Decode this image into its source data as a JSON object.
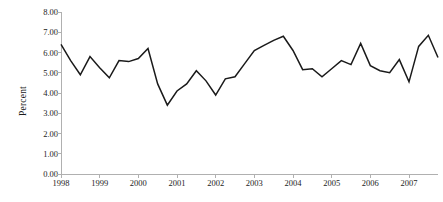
{
  "chart_data": {
    "type": "line",
    "title": "",
    "subtitle": "",
    "xlabel": "",
    "ylabel": "Percent",
    "ylim": [
      0,
      8
    ],
    "ytick_step": 1,
    "ytick_labels": [
      "8.00",
      "7.00",
      "6.00",
      "5.00",
      "4.00",
      "3.00",
      "2.00",
      "1.00",
      "0.00"
    ],
    "ytick_values": [
      8,
      7,
      6,
      5,
      4,
      3,
      2,
      1,
      0
    ],
    "xtick_labels": [
      "1998",
      "1999",
      "2000",
      "2001",
      "2002",
      "2003",
      "2004",
      "2005",
      "2006",
      "2007"
    ],
    "xtick_values": [
      1998,
      1999,
      2000,
      2001,
      2002,
      2003,
      2004,
      2005,
      2006,
      2007
    ],
    "xlim": [
      1998,
      2007.75
    ],
    "grid": false,
    "legend": false,
    "legend_position": "none",
    "series_color": "#1a1a1a",
    "axis_color": "#b0b0b0",
    "frequency": "quarterly",
    "series": [
      {
        "name": "Percent",
        "x": [
          1998.0,
          1998.25,
          1998.5,
          1998.75,
          1999.0,
          1999.25,
          1999.5,
          1999.75,
          2000.0,
          2000.25,
          2000.5,
          2000.75,
          2001.0,
          2001.25,
          2001.5,
          2001.75,
          2002.0,
          2002.25,
          2002.5,
          2002.75,
          2003.0,
          2003.25,
          2003.5,
          2003.75,
          2004.0,
          2004.25,
          2004.5,
          2004.75,
          2005.0,
          2005.25,
          2005.5,
          2005.75,
          2006.0,
          2006.25,
          2006.5,
          2006.75,
          2007.0,
          2007.25,
          2007.5,
          2007.75
        ],
        "values": [
          6.4,
          5.6,
          4.9,
          5.8,
          5.25,
          4.75,
          5.6,
          5.55,
          5.7,
          6.2,
          4.45,
          3.4,
          4.1,
          4.45,
          5.1,
          4.6,
          3.9,
          4.7,
          4.8,
          5.45,
          6.1,
          6.35,
          6.6,
          6.8,
          6.1,
          5.15,
          5.2,
          4.8,
          5.2,
          5.6,
          5.4,
          6.45,
          5.35,
          5.1,
          5.0,
          5.65,
          4.55,
          6.3,
          6.85,
          5.75
        ]
      }
    ],
    "min_value": 3.4,
    "max_value": 6.85
  }
}
